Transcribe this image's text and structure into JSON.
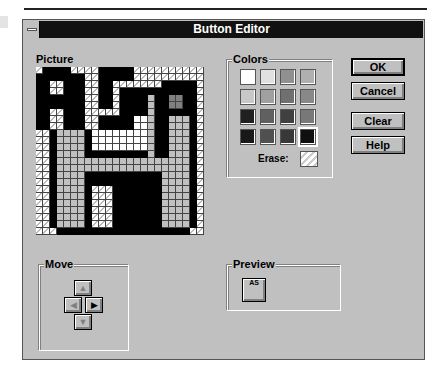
{
  "window": {
    "title": "Button Editor"
  },
  "picture": {
    "label": "Picture",
    "legend": {
      "W": "erase (transparent)",
      "K": "black",
      "G": "light gray",
      "S": "white",
      "D": "dark gray"
    },
    "rows": [
      "WKKKKWWWWKKKKKWWWWWWWWWW",
      "KKKKKKKWWKKKKKWWWWWWWWWW",
      "KKWWKKKWWKKWWWWWWWKKKKKW",
      "KKWWKKKWWKKWKKKKKKKKKKKW",
      "KKKKKKKWWKKWKKKKGKKDDKKW",
      "KKKKKKKWWKKWKKKKGKKDDKKW",
      "KKWWKKKWWWWWKKKKGKKKKKKW",
      "KKWWKKKWWKKKKKSSGKKGGGKW",
      "KKWWKKKWWKKKKKSSGKKGGGKW",
      "WWKGGGGKSSSSSSSSGKKGGGKW",
      "WWKGGGGKSSSSSSSSGKKGGGKW",
      "WWKGGGGKSSSSSSSSGKKGGGKW",
      "WWKGGGGKKKKKKKKKGKKGGGKW",
      "WWKGGGGGGGGGGGGGGGGGGGKW",
      "WWKGGGGGGGGGGGGGGGGGGGKW",
      "WWKGGGGKKKKKKKKKKKGGGGKW",
      "WWKGGGGKKKKKKKKKKKGGGGKW",
      "WWKGGGGKWWWKKKKKKKGGGGKW",
      "WWKGGGGKWWWKKKKKKKGGGGKW",
      "WWKGGGGKWWWKKKKKKKGGGGKW",
      "WWKGGGGKWWWKKKKKKKGGGGKW",
      "WWKGGGGKWWWKKKKKKKGGGGKW",
      "WWKGGGGKWWWKKKKKKKGGGGKW",
      "WWWKKKKKKKKKKKKKKKKKKKWW"
    ]
  },
  "colors": {
    "label": "Colors",
    "swatches": [
      "#ffffff",
      "#e0e0e0",
      "#909090",
      "#b0b0b0",
      "#c8c8c8",
      "#a0a0a0",
      "#707070",
      "#888888",
      "#202020",
      "#606060",
      "#404040",
      "#787878",
      "#181818",
      "#505050",
      "#383838",
      "#101010"
    ],
    "selected_index": 15,
    "erase_label": "Erase:"
  },
  "buttons": {
    "ok": "OK",
    "cancel": "Cancel",
    "clear": "Clear",
    "help": "Help"
  },
  "move": {
    "label": "Move",
    "up": "▲",
    "left": "◀",
    "right": "▶",
    "down": "▼"
  },
  "preview": {
    "label": "Preview",
    "icon_text": "AS"
  }
}
